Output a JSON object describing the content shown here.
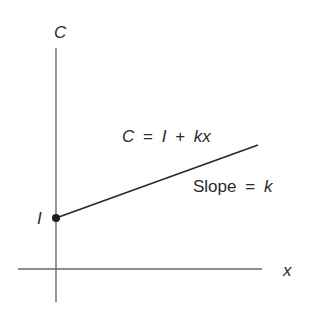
{
  "diagram": {
    "y_axis_label": "C",
    "x_axis_label": "x",
    "intercept_label": "I",
    "equation": {
      "lhs": "C",
      "eq": "=",
      "term1": "I",
      "plus": "+",
      "term2": "kx"
    },
    "slope": {
      "word": "Slope",
      "eq": "=",
      "value": "k"
    },
    "colors": {
      "axis": "#6a6a6a",
      "line": "#2a2a2a",
      "text": "#2a2a2a",
      "background": "#ffffff"
    }
  }
}
